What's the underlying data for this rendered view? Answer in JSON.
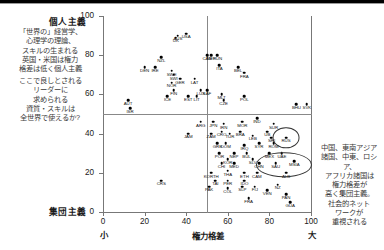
{
  "chart_data": {
    "type": "scatter",
    "title": "",
    "xlabel": "権力格差",
    "ylabel": "",
    "xlim": [
      0,
      100
    ],
    "ylim": [
      0,
      100
    ],
    "xticks": [
      0,
      20,
      40,
      60,
      80,
      100
    ],
    "yticks": [
      0,
      20,
      40,
      60,
      80,
      100
    ],
    "x_axis_low_label": "小",
    "x_axis_high_label": "大",
    "y_axis_top_label": "個人主義",
    "y_axis_bottom_label": "集団主義",
    "grid": false,
    "legend": "none",
    "reference_lines": {
      "x": 50,
      "y": 50
    },
    "points": [
      {
        "code": "AUS",
        "x": 36,
        "y": 90
      },
      {
        "code": "UK",
        "x": 35,
        "y": 89
      },
      {
        "code": "USA",
        "x": 40,
        "y": 91
      },
      {
        "code": "NET",
        "x": 52,
        "y": 80
      },
      {
        "code": "CAN",
        "x": 50,
        "y": 80
      },
      {
        "code": "HUN",
        "x": 55,
        "y": 80
      },
      {
        "code": "NZL",
        "x": 28,
        "y": 79
      },
      {
        "code": "DEN",
        "x": 20,
        "y": 74
      },
      {
        "code": "IRE",
        "x": 25,
        "y": 74
      },
      {
        "code": "SWE",
        "x": 33,
        "y": 72
      },
      {
        "code": "SWI",
        "x": 34,
        "y": 70
      },
      {
        "code": "GER",
        "x": 37,
        "y": 68
      },
      {
        "code": "LAT",
        "x": 44,
        "y": 68
      },
      {
        "code": "NOR",
        "x": 33,
        "y": 66
      },
      {
        "code": "ITA",
        "x": 56,
        "y": 75
      },
      {
        "code": "FIN",
        "x": 34,
        "y": 62
      },
      {
        "code": "ICE",
        "x": 31,
        "y": 59
      },
      {
        "code": "EST",
        "x": 41,
        "y": 59
      },
      {
        "code": "LIT",
        "x": 45,
        "y": 59
      },
      {
        "code": "LUX",
        "x": 47,
        "y": 62
      },
      {
        "code": "SAF",
        "x": 50,
        "y": 62
      },
      {
        "code": "AUT",
        "x": 12,
        "y": 57
      },
      {
        "code": "ISR",
        "x": 13,
        "y": 53
      },
      {
        "code": "BEL",
        "x": 65,
        "y": 74
      },
      {
        "code": "FRA",
        "x": 68,
        "y": 71
      },
      {
        "code": "MLT",
        "x": 57,
        "y": 60
      },
      {
        "code": "CZE",
        "x": 58,
        "y": 57
      },
      {
        "code": "POL",
        "x": 68,
        "y": 59
      },
      {
        "code": "BHU",
        "x": 93,
        "y": 55
      },
      {
        "code": "SVK",
        "x": 98,
        "y": 55
      },
      {
        "code": "ARG",
        "x": 47,
        "y": 46
      },
      {
        "code": "JPN",
        "x": 53,
        "y": 46
      },
      {
        "code": "IRN",
        "x": 58,
        "y": 45
      },
      {
        "code": "MOR",
        "x": 67,
        "y": 46
      },
      {
        "code": "IND",
        "x": 74,
        "y": 48
      },
      {
        "code": "SUR",
        "x": 82,
        "y": 45
      },
      {
        "code": "JAM",
        "x": 41,
        "y": 40
      },
      {
        "code": "ZAM",
        "x": 52,
        "y": 40
      },
      {
        "code": "CRO",
        "x": 57,
        "y": 41
      },
      {
        "code": "TUR",
        "x": 61,
        "y": 40
      },
      {
        "code": "BRA",
        "x": 66,
        "y": 41
      },
      {
        "code": "LEB",
        "x": 72,
        "y": 39
      },
      {
        "code": "UB",
        "x": 79,
        "y": 41
      },
      {
        "code": "SRI",
        "x": 81,
        "y": 38
      },
      {
        "code": "RUS",
        "x": 88,
        "y": 38
      },
      {
        "code": "GRE",
        "x": 55,
        "y": 35
      },
      {
        "code": "DOM",
        "x": 59,
        "y": 35
      },
      {
        "code": "IRQ",
        "x": 68,
        "y": 34
      },
      {
        "code": "SYR",
        "x": 75,
        "y": 35
      },
      {
        "code": "ROM",
        "x": 82,
        "y": 35
      },
      {
        "code": "POR",
        "x": 56,
        "y": 30
      },
      {
        "code": "NEP",
        "x": 63,
        "y": 30
      },
      {
        "code": "BUL",
        "x": 69,
        "y": 30
      },
      {
        "code": "MEX",
        "x": 80,
        "y": 30
      },
      {
        "code": "UAE",
        "x": 86,
        "y": 30
      },
      {
        "code": "KOR",
        "x": 60,
        "y": 27
      },
      {
        "code": "SLV",
        "x": 72,
        "y": 27
      },
      {
        "code": "CHI",
        "x": 57,
        "y": 25
      },
      {
        "code": "MED",
        "x": 63,
        "y": 25
      },
      {
        "code": "CHN",
        "x": 75,
        "y": 25
      },
      {
        "code": "SAU",
        "x": 83,
        "y": 25
      },
      {
        "code": "MSIA",
        "x": 92,
        "y": 26
      },
      {
        "code": "KORTH",
        "x": 52,
        "y": 20
      },
      {
        "code": "THA",
        "x": 60,
        "y": 21
      },
      {
        "code": "ETH",
        "x": 68,
        "y": 20
      },
      {
        "code": "CAM",
        "x": 74,
        "y": 20
      },
      {
        "code": "ALB",
        "x": 88,
        "y": 20
      },
      {
        "code": "TAI",
        "x": 54,
        "y": 16
      },
      {
        "code": "PER",
        "x": 60,
        "y": 16
      },
      {
        "code": "IDO",
        "x": 68,
        "y": 16
      },
      {
        "code": "PAK",
        "x": 51,
        "y": 13
      },
      {
        "code": "COL",
        "x": 60,
        "y": 12
      },
      {
        "code": "SLP",
        "x": 67,
        "y": 13
      },
      {
        "code": "FIJ",
        "x": 73,
        "y": 13
      },
      {
        "code": "VEN",
        "x": 79,
        "y": 11
      },
      {
        "code": "NZ",
        "x": 84,
        "y": 14
      },
      {
        "code": "CRS",
        "x": 28,
        "y": 16
      },
      {
        "code": "FRA2",
        "x": 70,
        "y": 7
      },
      {
        "code": "PAN",
        "x": 88,
        "y": 9
      },
      {
        "code": "GUA",
        "x": 90,
        "y": 5
      }
    ],
    "highlight_ellipses": [
      {
        "cx": 88,
        "cy": 38,
        "rx": 6,
        "ry": 5
      },
      {
        "cx": 87,
        "cy": 24,
        "rx": 13,
        "ry": 6
      }
    ]
  },
  "annotations": {
    "left_top": "「世界の」経営学、\n心理学の理論、\nスキルの生まれる\n英国・米国は権力\n格差は低く個人主義",
    "left_bottom": "ここで良しとされる\nリーダーに\n求められる\n資質・スキルは\n全世界で使えるか?",
    "right": "中国、東南アジア\n諸国、中東、ロシア、\nアフリカ諸国は\n権力格差が\n高く集団主義。\n社会的ネット\nワークが\n重視される"
  },
  "colors": {
    "point": "#000000",
    "axis": "#777777",
    "text": "#1a1a1a",
    "annotation_text": "#3a3a3a"
  }
}
